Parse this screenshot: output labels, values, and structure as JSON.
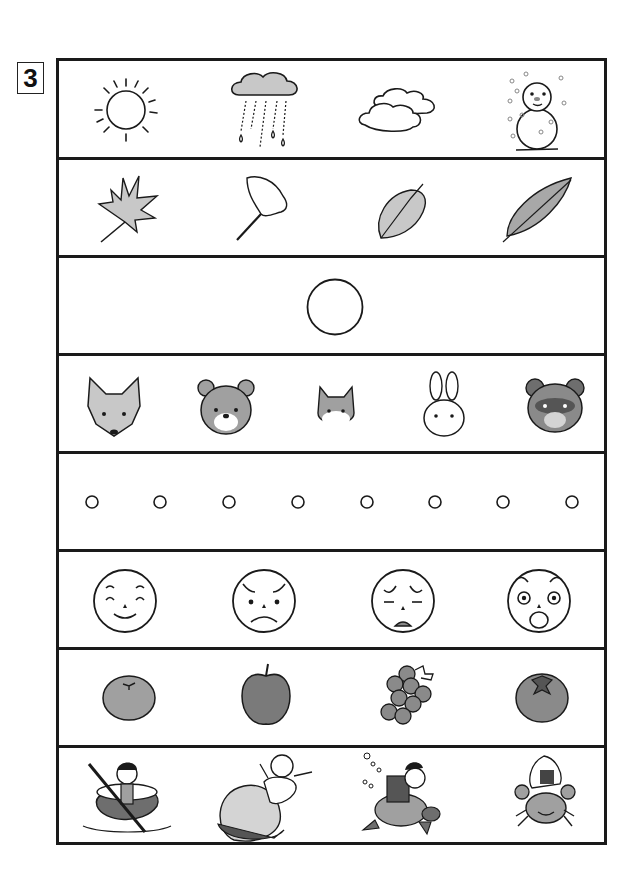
{
  "worksheet": {
    "question_number": "3",
    "rows": [
      {
        "id": "weather",
        "items": [
          "sun",
          "rain-cloud",
          "clouds",
          "snowman"
        ]
      },
      {
        "id": "leaves",
        "items": [
          "maple-leaf",
          "ginkgo-leaf",
          "oval-leaf",
          "serrated-leaf"
        ]
      },
      {
        "id": "single-circle",
        "items": [
          "circle"
        ]
      },
      {
        "id": "animals",
        "items": [
          "fox",
          "bear",
          "squirrel",
          "rabbit",
          "tanuki"
        ]
      },
      {
        "id": "small-circles",
        "count": 8
      },
      {
        "id": "faces",
        "items": [
          "happy-face",
          "angry-face",
          "sad-face",
          "surprised-face"
        ]
      },
      {
        "id": "fruits",
        "items": [
          "mandarin-orange",
          "apple",
          "grapes",
          "persimmon"
        ]
      },
      {
        "id": "folktales",
        "items": [
          "issun-boshi-in-bowl",
          "momotaro-peach",
          "urashima-taro-turtle",
          "crab-with-rice-ball"
        ]
      }
    ]
  },
  "colors": {
    "line": "#1a1a1a",
    "light_gray": "#c8c8c8",
    "mid_gray": "#a0a0a0",
    "dark_gray": "#6e6e6e"
  }
}
